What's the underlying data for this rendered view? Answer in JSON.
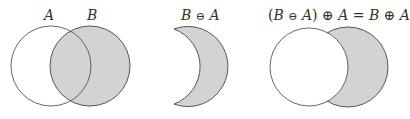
{
  "colors": {
    "fill": "#d3d3d3",
    "stroke": "#555555",
    "background": "#ffffff",
    "text": "#333333"
  },
  "panel1": {
    "label_a": "A",
    "label_b": "B"
  },
  "panel2": {
    "label_left": "B",
    "label_op": "⊖",
    "label_right": "A"
  },
  "panel3": {
    "open_paren": "(",
    "b1": "B",
    "op1": "⊖",
    "a1": "A",
    "close_paren": ")",
    "op2": "⊕",
    "a2": "A",
    "equals": "=",
    "b2": "B",
    "op3": "⊕",
    "a3": "A"
  }
}
